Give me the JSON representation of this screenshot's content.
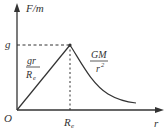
{
  "diagram": {
    "y_axis_label": "F/m",
    "x_axis_label": "r",
    "origin_label": "O",
    "g_label": "g",
    "re_label": "R",
    "re_sub": "e",
    "inside_formula": {
      "num": "gr",
      "den": "R",
      "den_sub": "e"
    },
    "outside_formula": {
      "num": "GM",
      "den": "r",
      "den_sup": "2"
    },
    "line_color": "#333333"
  }
}
